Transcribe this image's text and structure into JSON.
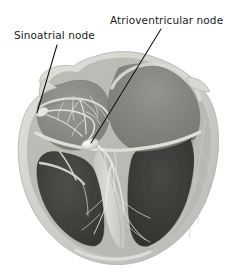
{
  "figure": {
    "background_color": "#ffffff"
  },
  "labels": [
    {
      "id": "sinoatrial-node",
      "text": "Sinoatrial node",
      "x": 14,
      "y": 39,
      "anchor": "start"
    },
    {
      "id": "atrioventricular-node",
      "text": "Atrioventricular node",
      "x": 110,
      "y": 24,
      "anchor": "start"
    }
  ],
  "leader_lines": [
    {
      "id": "sinoatrial-leader",
      "from_x": 57,
      "from_y": 45,
      "to_x": 37,
      "to_y": 113,
      "color": "#111111",
      "width": 1.1
    },
    {
      "id": "atrioventricular-leader",
      "from_x": 161,
      "from_y": 29,
      "to_x": 91,
      "to_y": 143,
      "color": "#111111",
      "width": 1.1
    }
  ],
  "anatomy": {
    "outer_wall_color": "#cfcfc9",
    "outer_wall_highlight": "#e2e2dd",
    "outer_wall_shadow": "#b4b4ae",
    "myocardium_color": "#9a9a94",
    "atrium_cavity_color": "#8a8a85",
    "atrium_cavity_dark": "#7c7c77",
    "ventricle_cavity_color": "#3c3c3a",
    "ventricle_cavity_light": "#4e4e4b",
    "septum_color": "#d3d3cd",
    "conduction_fiber_color": "#e8e8e2",
    "av_node_color": "#efefe9",
    "sa_node_color": "#e4e4de",
    "outline_color": "#8d8d87"
  },
  "structures": [
    {
      "id": "left-atrium",
      "name": "Left atrium"
    },
    {
      "id": "right-atrium",
      "name": "Right atrium"
    },
    {
      "id": "left-ventricle",
      "name": "Left ventricle"
    },
    {
      "id": "right-ventricle",
      "name": "Right ventricle"
    },
    {
      "id": "interventricular-septum",
      "name": "Interventricular septum"
    },
    {
      "id": "sa-node-marker",
      "name": "Sinoatrial node"
    },
    {
      "id": "av-node-marker",
      "name": "Atrioventricular node"
    },
    {
      "id": "bundle-of-his",
      "name": "Bundle of His"
    },
    {
      "id": "purkinje-fibers",
      "name": "Purkinje fibers"
    }
  ]
}
